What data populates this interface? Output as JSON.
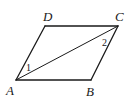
{
  "diagram": {
    "type": "geometry",
    "shape": "parallelogram",
    "name": "ABCD",
    "stroke_color": "#1a1a1a",
    "background": "#ffffff",
    "vertices": [
      {
        "label": "A",
        "x": 16,
        "y": 80,
        "label_x": 6,
        "label_y": 95
      },
      {
        "label": "B",
        "x": 91,
        "y": 80,
        "label_x": 86,
        "label_y": 96
      },
      {
        "label": "C",
        "x": 118,
        "y": 26,
        "label_x": 115,
        "label_y": 21
      },
      {
        "label": "D",
        "x": 45,
        "y": 26,
        "label_x": 43,
        "label_y": 21
      }
    ],
    "edges": [
      [
        "A",
        "B"
      ],
      [
        "B",
        "C"
      ],
      [
        "C",
        "D"
      ],
      [
        "D",
        "A"
      ]
    ],
    "diagonals": [
      [
        "A",
        "C"
      ]
    ],
    "angle_marks": [
      {
        "label": "1",
        "vertex": "A",
        "between": [
          "AD",
          "AC"
        ],
        "x": 26,
        "y": 71
      },
      {
        "label": "2",
        "vertex": "C",
        "between": [
          "CA",
          "CB"
        ],
        "x": 102,
        "y": 46
      }
    ]
  }
}
